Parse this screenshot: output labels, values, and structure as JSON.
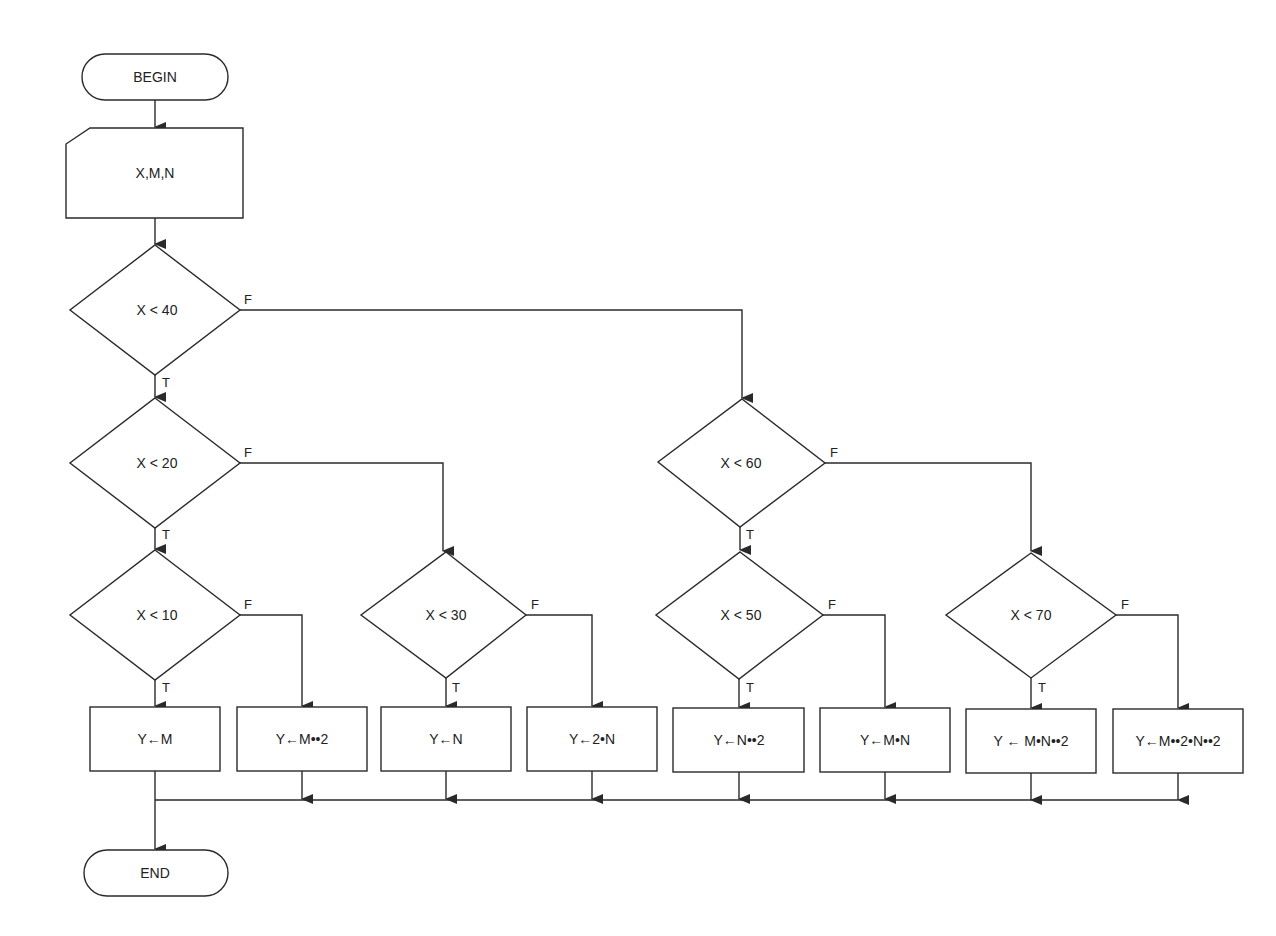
{
  "diagram": {
    "type": "flowchart",
    "start": {
      "label": "BEGIN",
      "x": 155,
      "y": 77,
      "w": 146,
      "h": 46
    },
    "input": {
      "label": "X,M,N",
      "x": 66,
      "y": 128,
      "w": 177,
      "h": 90
    },
    "end": {
      "label": "END",
      "x": 155,
      "y": 873,
      "w": 146,
      "h": 46
    },
    "branch_labels": {
      "true": "T",
      "false": "F"
    },
    "decisions": [
      {
        "id": "d40",
        "label": "X < 40",
        "cx": 155,
        "cy": 310,
        "hw": 85,
        "hh": 65
      },
      {
        "id": "d20",
        "label": "X < 20",
        "cx": 155,
        "cy": 463,
        "hw": 85,
        "hh": 65
      },
      {
        "id": "d10",
        "label": "X < 10",
        "cx": 155,
        "cy": 615,
        "hw": 85,
        "hh": 65
      },
      {
        "id": "d30",
        "label": "X < 30",
        "cx": 443,
        "cy": 615,
        "hw": 83,
        "hh": 63
      },
      {
        "id": "d60",
        "label": "X < 60",
        "cx": 741,
        "cy": 463,
        "hw": 84,
        "hh": 64
      },
      {
        "id": "d50",
        "label": "X < 50",
        "cx": 739,
        "cy": 615,
        "hw": 84,
        "hh": 64
      },
      {
        "id": "d70",
        "label": "X < 70",
        "cx": 1031,
        "cy": 615,
        "hw": 85,
        "hh": 63
      }
    ],
    "processes": [
      {
        "id": "p1",
        "label": "Y←M",
        "x": 90,
        "y": 707,
        "w": 130,
        "h": 64
      },
      {
        "id": "p2",
        "label": "Y←M••2",
        "x": 237,
        "y": 707,
        "w": 130,
        "h": 64
      },
      {
        "id": "p3",
        "label": "Y←N",
        "x": 381,
        "y": 707,
        "w": 130,
        "h": 64
      },
      {
        "id": "p4",
        "label": "Y←2•N",
        "x": 527,
        "y": 707,
        "w": 130,
        "h": 64
      },
      {
        "id": "p5",
        "label": "Y←N••2",
        "x": 673,
        "y": 708,
        "w": 130,
        "h": 64
      },
      {
        "id": "p6",
        "label": "Y←M•N",
        "x": 820,
        "y": 708,
        "w": 130,
        "h": 64
      },
      {
        "id": "p7",
        "label": "Y ← M•N••2",
        "x": 966,
        "y": 709,
        "w": 130,
        "h": 64
      },
      {
        "id": "p8",
        "label": "Y←M••2•N••2",
        "x": 1113,
        "y": 709,
        "w": 130,
        "h": 64
      }
    ],
    "collector_y": 800
  }
}
